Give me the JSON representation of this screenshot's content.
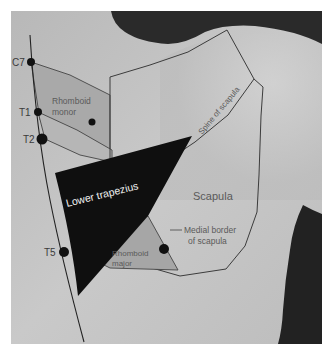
{
  "figure": {
    "type": "anatomical-photo-diagram"
  },
  "vertebrae": [
    {
      "label": "C7",
      "x": 31,
      "y": 62
    },
    {
      "label": "T1",
      "x": 38,
      "y": 112
    },
    {
      "label": "T2",
      "x": 42,
      "y": 139
    },
    {
      "label": "T5",
      "x": 64,
      "y": 252
    }
  ],
  "labels": {
    "rhomboid_minor_line1": "Rhomboid",
    "rhomboid_minor_line2": "monor",
    "spine_of_scapula": "Spine of scapula",
    "lower_trapezius": "Lower trapezius",
    "scapula": "Scapula",
    "medial_border_line1": "Medial border",
    "medial_border_line2": "of scapula",
    "rhomboid_major_line1": "Rhomboid",
    "rhomboid_major_line2": "major"
  },
  "colors": {
    "background_border": "#ffffff",
    "skin_light": "#c8c8c8",
    "skin_mid": "#b4b4b4",
    "shadow": "#2a2a2a",
    "outline": "#3c3c3c",
    "rhomboid_fill": "#a8a8a8",
    "trapezius_fill": "#101010",
    "marker": "#111111"
  }
}
